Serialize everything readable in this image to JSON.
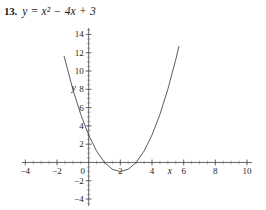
{
  "problem": {
    "number": "13.",
    "equation": "y = x² − 4x + 3"
  },
  "chart_data": {
    "type": "line",
    "title": "y = x² − 4x + 3",
    "xlabel": "x",
    "ylabel": "y",
    "xlim": [
      -5.6,
      11.2
    ],
    "ylim": [
      -5.2,
      15.8
    ],
    "grid": false,
    "legend": null,
    "axis_color": "#555555",
    "curve_color": "#4a4a4a",
    "background": "#ffffff",
    "x_ticks": [
      -4,
      -2,
      0,
      2,
      4,
      6,
      8,
      10
    ],
    "x_tick_labels": [
      "−4",
      "−2",
      "0",
      "2",
      "4",
      "6",
      "8",
      "10"
    ],
    "y_ticks": [
      -4,
      -2,
      0,
      2,
      4,
      6,
      8,
      10,
      12,
      14
    ],
    "y_tick_labels": [
      "−4",
      "−2",
      "0",
      "2",
      "4",
      "6",
      "8",
      "10",
      "12",
      "14"
    ],
    "x_minor_tick_step": 0.5,
    "y_minor_tick_step": 0.5,
    "function": "x^2 - 4x + 3",
    "vertex": [
      2,
      -1
    ],
    "roots": [
      1,
      3
    ],
    "y_intercept": 3,
    "curve_x_range": [
      -1.55,
      5.7
    ],
    "points": [
      {
        "x": -1.55,
        "y": 11.6
      },
      {
        "x": -1.0,
        "y": 8.0
      },
      {
        "x": -0.5,
        "y": 5.25
      },
      {
        "x": 0.0,
        "y": 3.0
      },
      {
        "x": 0.5,
        "y": 1.25
      },
      {
        "x": 1.0,
        "y": 0.0
      },
      {
        "x": 1.5,
        "y": -0.75
      },
      {
        "x": 2.0,
        "y": -1.0
      },
      {
        "x": 2.5,
        "y": -0.75
      },
      {
        "x": 3.0,
        "y": 0.0
      },
      {
        "x": 3.5,
        "y": 1.25
      },
      {
        "x": 4.0,
        "y": 3.0
      },
      {
        "x": 4.5,
        "y": 5.25
      },
      {
        "x": 5.0,
        "y": 8.0
      },
      {
        "x": 5.5,
        "y": 11.25
      },
      {
        "x": 5.7,
        "y": 12.69
      }
    ]
  }
}
